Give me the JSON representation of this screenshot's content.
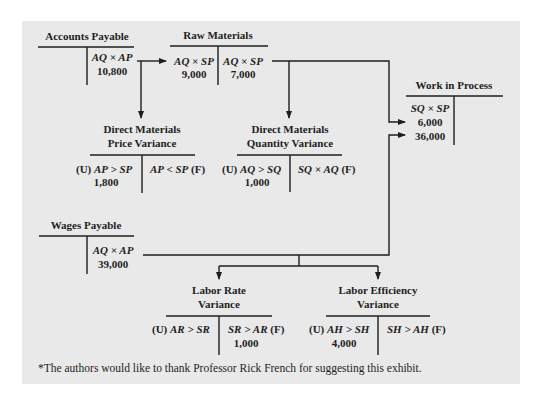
{
  "accounts": {
    "accounts_payable": {
      "title": "Accounts Payable",
      "credit_formula": "AQ × AP",
      "credit_value": "10,800"
    },
    "raw_materials": {
      "title": "Raw Materials",
      "debit_formula": "AQ × SP",
      "debit_value": "9,000",
      "credit_formula": "AQ × SP",
      "credit_value": "7,000"
    },
    "work_in_process": {
      "title": "Work in Process",
      "debit_formula": "SQ × SP",
      "debit_values": [
        "6,000",
        "36,000"
      ]
    },
    "dm_price_variance": {
      "title_line1": "Direct Materials",
      "title_line2": "Price Variance",
      "debit_label_prefix": "(U)",
      "debit_formula": "AP > SP",
      "debit_value": "1,800",
      "credit_formula": "AP < SP",
      "credit_label_suffix": "(F)"
    },
    "dm_quantity_variance": {
      "title_line1": "Direct Materials",
      "title_line2": "Quantity Variance",
      "debit_label_prefix": "(U)",
      "debit_formula": "AQ > SQ",
      "debit_value": "1,000",
      "credit_formula": "SQ × AQ",
      "credit_label_suffix": "(F)"
    },
    "wages_payable": {
      "title": "Wages Payable",
      "credit_formula": "AQ × AP",
      "credit_value": "39,000"
    },
    "labor_rate_variance": {
      "title_line1": "Labor Rate",
      "title_line2": "Variance",
      "debit_label_prefix": "(U)",
      "debit_formula": "AR > SR",
      "credit_formula": "SR > AR",
      "credit_label_suffix": "(F)",
      "credit_value": "1,000"
    },
    "labor_efficiency_variance": {
      "title_line1": "Labor Efficiency",
      "title_line2": "Variance",
      "debit_label_prefix": "(U)",
      "debit_formula": "AH > SH",
      "debit_value": "4,000",
      "credit_formula": "SH > AH",
      "credit_label_suffix": "(F)"
    }
  },
  "footnote": "*The authors would like to thank Professor Rick French for suggesting this exhibit.",
  "colors": {
    "panel": "#e9e9e9",
    "ink": "#1e1e1e"
  }
}
